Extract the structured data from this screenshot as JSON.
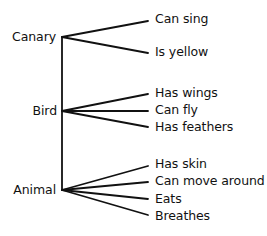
{
  "diagram": {
    "type": "semantic-network hierarchy",
    "line_color": "#111111",
    "nodes": [
      {
        "label": "Canary",
        "properties": [
          "Can sing",
          "Is yellow"
        ]
      },
      {
        "label": "Bird",
        "properties": [
          "Has wings",
          "Can fly",
          "Has feathers"
        ]
      },
      {
        "label": "Animal",
        "properties": [
          "Has skin",
          "Can move around",
          "Eats",
          "Breathes"
        ]
      }
    ]
  }
}
